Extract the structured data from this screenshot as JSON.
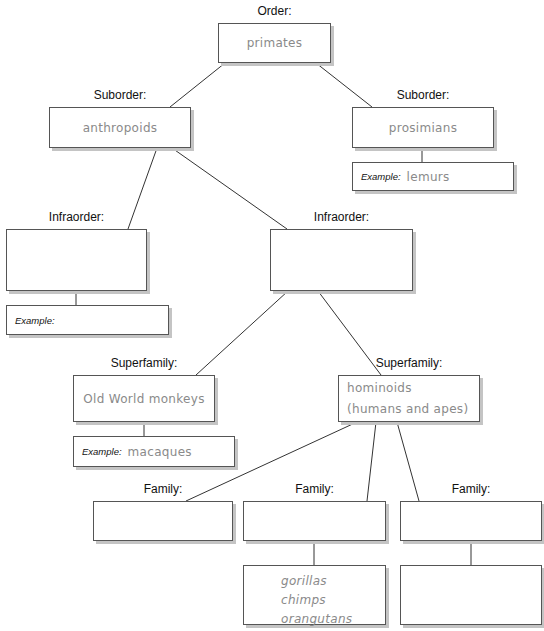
{
  "diagram": {
    "order": {
      "label": "Order:",
      "value": "primates"
    },
    "suborders": [
      {
        "label": "Suborder:",
        "value": "anthropoids"
      },
      {
        "label": "Suborder:",
        "value": "prosimians",
        "example_label": "Example:",
        "example_value": "lemurs"
      }
    ],
    "infraorders": [
      {
        "label": "Infraorder:",
        "value": "",
        "example_label": "Example:",
        "example_value": ""
      },
      {
        "label": "Infraorder:",
        "value": ""
      }
    ],
    "superfamilies": [
      {
        "label": "Superfamily:",
        "value": "Old World monkeys",
        "example_label": "Example:",
        "example_value": "macaques"
      },
      {
        "label": "Superfamily:",
        "value_line1": "hominoids",
        "value_line2": "(humans and apes)"
      }
    ],
    "families": [
      {
        "label": "Family:",
        "value": ""
      },
      {
        "label": "Family:",
        "value": "",
        "members": [
          "gorillas",
          "chimps",
          "orangutans"
        ]
      },
      {
        "label": "Family:",
        "value": "",
        "members": []
      }
    ]
  }
}
